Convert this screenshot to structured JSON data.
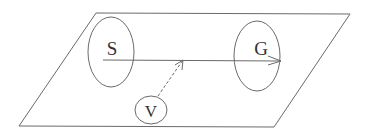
{
  "diagram": {
    "nodes": [
      {
        "id": "S",
        "label": "S",
        "shape": "ellipse"
      },
      {
        "id": "G",
        "label": "G",
        "shape": "ellipse"
      },
      {
        "id": "V",
        "label": "V",
        "shape": "ellipse"
      }
    ],
    "edges": [
      {
        "from": "S",
        "to": "G",
        "style": "solid",
        "arrow": true
      },
      {
        "from": "V",
        "to": "S-G line",
        "style": "dashed",
        "arrow": true
      }
    ],
    "plane": {
      "shape": "parallelogram"
    },
    "colors": {
      "stroke": "#6a6a6a",
      "text": "#333333",
      "background": "#ffffff"
    }
  }
}
